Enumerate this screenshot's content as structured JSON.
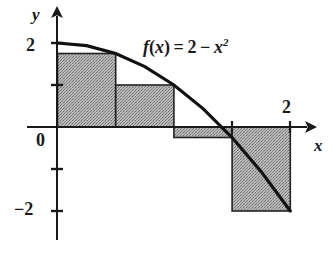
{
  "figure": {
    "kind": "riemann-sum-diagram",
    "title": "",
    "function_label": {
      "prefix": "f",
      "arg_open": "(",
      "arg": "x",
      "arg_close": ")",
      "equals": "=",
      "constant": "2",
      "minus": "−",
      "variable": "x",
      "exponent": "2",
      "full": "f(x) = 2 − x²"
    },
    "axes": {
      "x_label": "x",
      "y_label": "y",
      "origin_label": "0",
      "y_tick_top_label": "2",
      "y_tick_bottom_label": "−2",
      "x_tick_right_label": "2"
    },
    "colors": {
      "ink": "#1a1a1a",
      "curve": "#111111",
      "rect_fill": "#a8a8a8",
      "rect_stroke": "#222222",
      "background": "#ffffff"
    }
  },
  "chart_data": {
    "type": "area",
    "xlabel": "x",
    "ylabel": "y",
    "xlim": [
      -0.12,
      2.3
    ],
    "ylim": [
      -2.6,
      2.6
    ],
    "grid": false,
    "legend": null,
    "curve": {
      "name": "f(x) = 2 - x^2",
      "expression": "2 - x^2",
      "x": [
        0,
        0.25,
        0.5,
        0.75,
        1,
        1.25,
        1.5,
        1.75,
        2
      ],
      "y": [
        2,
        1.9375,
        1.75,
        1.4375,
        1,
        0.4375,
        -0.25,
        -1.0625,
        -2
      ]
    },
    "riemann_sum": {
      "method": "right endpoints",
      "n": 4,
      "interval": [
        0,
        2
      ],
      "delta_x": 0.5,
      "rectangles": [
        {
          "x0": 0.0,
          "x1": 0.5,
          "height": 1.75,
          "signed_area": 0.875
        },
        {
          "x0": 0.5,
          "x1": 1.0,
          "height": 1.0,
          "signed_area": 0.5
        },
        {
          "x0": 1.0,
          "x1": 1.5,
          "height": -0.25,
          "signed_area": -0.125
        },
        {
          "x0": 1.5,
          "x1": 2.0,
          "height": -2.0,
          "signed_area": -1.0
        }
      ],
      "total_signed_area": 0.25
    },
    "x_ticks": [
      1.5,
      2
    ],
    "x_tick_labels": [
      "",
      "2"
    ],
    "y_ticks": [
      2,
      1,
      0,
      -1,
      -2
    ],
    "y_tick_labels": [
      "2",
      "",
      "0",
      "",
      "−2"
    ]
  }
}
